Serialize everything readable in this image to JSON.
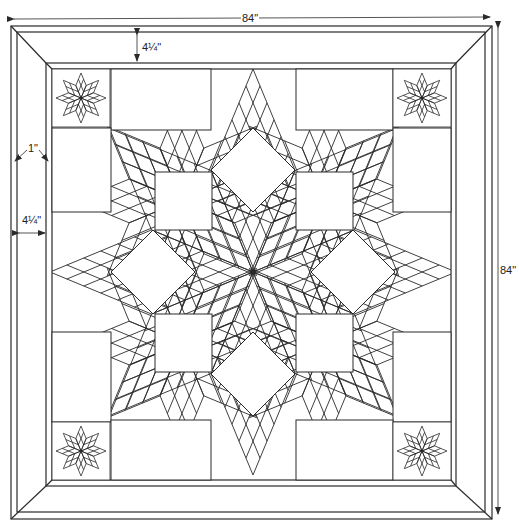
{
  "diagram": {
    "colors": {
      "line": "#2a2a2a",
      "background": "#ffffff",
      "fill": "#ffffff"
    },
    "dimensions": {
      "width_label": "84\"",
      "height_label": "84\"",
      "outer_border_label": "4¼\"",
      "narrow_border_label": "1\"",
      "side_border_label": "4¼\""
    },
    "borders": {
      "outer": {
        "x1": 11,
        "y1": 26,
        "x2": 492,
        "y2": 519
      },
      "outer_inner": {
        "x1": 17,
        "y1": 32,
        "x2": 485,
        "y2": 512
      },
      "wide_inner": {
        "x1": 46,
        "y1": 63,
        "x2": 456,
        "y2": 486
      },
      "field": {
        "x1": 52,
        "y1": 69,
        "x2": 451,
        "y2": 480
      }
    },
    "center": {
      "x": 253,
      "y": 272
    },
    "star": {
      "tip": 203,
      "side": 110,
      "grid": 6
    },
    "corner_blocks": [
      {
        "name": "top-left",
        "x": 52,
        "y": 69
      },
      {
        "name": "top-right",
        "x": 393,
        "y": 69
      },
      {
        "name": "bottom-left",
        "x": 52,
        "y": 422
      },
      {
        "name": "bottom-right",
        "x": 393,
        "y": 422
      }
    ],
    "corner_block_size": 58,
    "mini_star": {
      "tip": 25,
      "grid": 2
    },
    "white_squares": [
      {
        "x": 155,
        "y": 172,
        "w": 57,
        "h": 58
      },
      {
        "x": 296,
        "y": 172,
        "w": 57,
        "h": 58
      },
      {
        "x": 155,
        "y": 314,
        "w": 57,
        "h": 58
      },
      {
        "x": 296,
        "y": 314,
        "w": 57,
        "h": 58
      },
      {
        "x": 111,
        "y": 69,
        "w": 100,
        "h": 61
      },
      {
        "x": 296,
        "y": 69,
        "w": 97,
        "h": 61
      },
      {
        "x": 52,
        "y": 128,
        "w": 59,
        "h": 84
      },
      {
        "x": 393,
        "y": 128,
        "w": 58,
        "h": 84
      },
      {
        "x": 52,
        "y": 332,
        "w": 59,
        "h": 90
      },
      {
        "x": 393,
        "y": 332,
        "w": 58,
        "h": 90
      },
      {
        "x": 111,
        "y": 420,
        "w": 100,
        "h": 60
      },
      {
        "x": 296,
        "y": 420,
        "w": 97,
        "h": 60
      }
    ],
    "white_diamonds": [
      {
        "cx": 253,
        "cy": 170,
        "r": 42
      },
      {
        "cx": 253,
        "cy": 374,
        "r": 42
      },
      {
        "cx": 153,
        "cy": 272,
        "r": 42
      },
      {
        "cx": 353,
        "cy": 272,
        "r": 42
      }
    ]
  }
}
